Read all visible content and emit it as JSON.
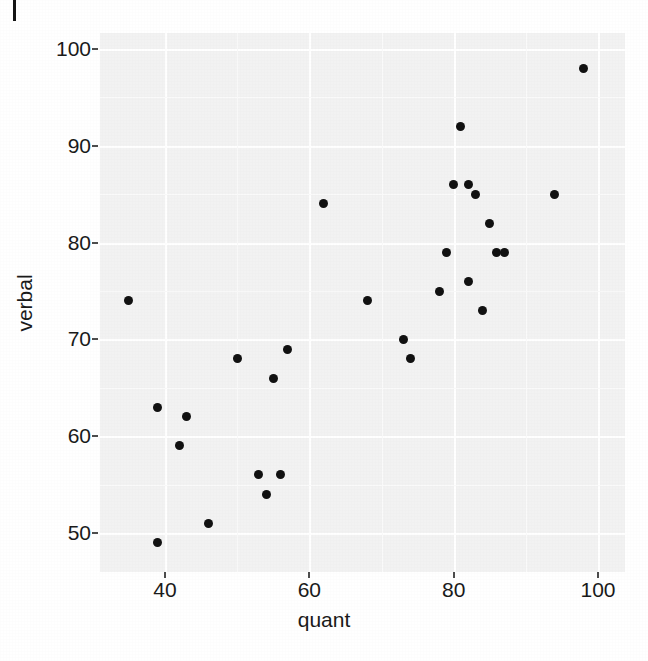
{
  "figure": {
    "artifact_name": "page-edge-mark",
    "background_color": "#ffffff",
    "panel_color": "#f2f2f2",
    "grid_color": "#ffffff",
    "point_color": "#111111"
  },
  "chart_data": {
    "type": "scatter",
    "title": "",
    "xlabel": "quant",
    "ylabel": "verbal",
    "xlim": [
      33,
      101
    ],
    "ylim": [
      47,
      101
    ],
    "xticks": [
      40,
      60,
      80,
      100
    ],
    "yticks": [
      50,
      60,
      70,
      80,
      90,
      100
    ],
    "xtick_labels": [
      "40",
      "60",
      "80",
      "100"
    ],
    "ytick_labels": [
      "50",
      "60",
      "70",
      "80",
      "90",
      "100"
    ],
    "grid": true,
    "legend": false,
    "n_points": 29,
    "x": [
      35,
      39,
      39,
      42,
      43,
      46,
      50,
      53,
      54,
      55,
      56,
      57,
      62,
      68,
      73,
      74,
      78,
      79,
      80,
      81,
      82,
      82,
      83,
      84,
      85,
      86,
      87,
      94,
      98
    ],
    "y": [
      74,
      49,
      63,
      59,
      62,
      51,
      68,
      56,
      54,
      66,
      56,
      69,
      84,
      74,
      70,
      68,
      75,
      79,
      86,
      92,
      86,
      76,
      85,
      73,
      82,
      79,
      79,
      94,
      98
    ],
    "points": [
      {
        "quant": 35,
        "verbal": 74
      },
      {
        "quant": 39,
        "verbal": 49
      },
      {
        "quant": 39,
        "verbal": 63
      },
      {
        "quant": 42,
        "verbal": 59
      },
      {
        "quant": 43,
        "verbal": 62
      },
      {
        "quant": 46,
        "verbal": 51
      },
      {
        "quant": 50,
        "verbal": 68
      },
      {
        "quant": 53,
        "verbal": 56
      },
      {
        "quant": 54,
        "verbal": 54
      },
      {
        "quant": 55,
        "verbal": 66
      },
      {
        "quant": 56,
        "verbal": 56
      },
      {
        "quant": 57,
        "verbal": 69
      },
      {
        "quant": 62,
        "verbal": 84
      },
      {
        "quant": 68,
        "verbal": 74
      },
      {
        "quant": 73,
        "verbal": 70
      },
      {
        "quant": 74,
        "verbal": 68
      },
      {
        "quant": 78,
        "verbal": 75
      },
      {
        "quant": 79,
        "verbal": 79
      },
      {
        "quant": 80,
        "verbal": 86
      },
      {
        "quant": 81,
        "verbal": 92
      },
      {
        "quant": 82,
        "verbal": 86
      },
      {
        "quant": 82,
        "verbal": 76
      },
      {
        "quant": 83,
        "verbal": 85
      },
      {
        "quant": 84,
        "verbal": 73
      },
      {
        "quant": 85,
        "verbal": 82
      },
      {
        "quant": 86,
        "verbal": 79
      },
      {
        "quant": 87,
        "verbal": 79
      },
      {
        "quant": 94,
        "verbal": 85
      },
      {
        "quant": 98,
        "verbal": 98
      }
    ]
  }
}
